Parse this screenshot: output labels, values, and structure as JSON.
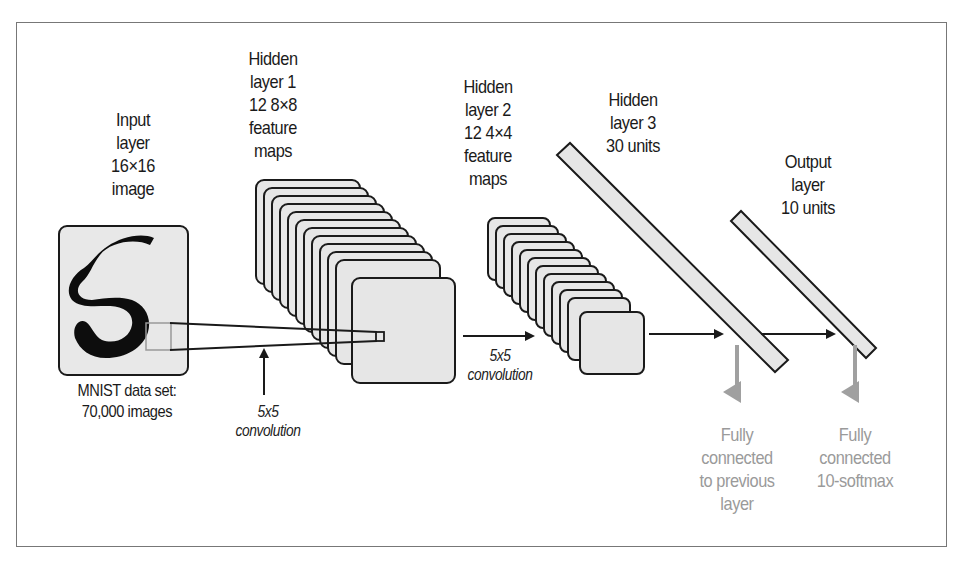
{
  "figure": {
    "input_layer": {
      "lines": [
        "Input",
        "layer",
        "16×16",
        "image"
      ]
    },
    "dataset_caption": {
      "lines": [
        "MNIST data set:",
        "70,000 images"
      ]
    },
    "hidden_layer_1": {
      "lines": [
        "Hidden",
        "layer 1",
        "12 8×8",
        "feature",
        "maps"
      ],
      "map_count": 12
    },
    "conv1_label": {
      "lines": [
        "5x5",
        "convolution"
      ]
    },
    "hidden_layer_2": {
      "lines": [
        "Hidden",
        "layer 2",
        "12 4×4",
        "feature",
        "maps"
      ],
      "map_count": 12
    },
    "conv2_label": {
      "lines": [
        "5x5",
        "convolution"
      ]
    },
    "hidden_layer_3": {
      "lines": [
        "Hidden",
        "layer 3",
        "30 units"
      ]
    },
    "output_layer": {
      "lines": [
        "Output",
        "layer",
        "10 units"
      ]
    },
    "fc1_label": {
      "lines": [
        "Fully",
        "connected",
        "to previous",
        "layer"
      ]
    },
    "fc2_label": {
      "lines": [
        "Fully",
        "connected",
        "10-softmax"
      ]
    },
    "colors": {
      "fill": "#e6e6e6",
      "stroke": "#1a1a1a",
      "annotation": "#9a9a9a",
      "frame": "#777777"
    }
  }
}
